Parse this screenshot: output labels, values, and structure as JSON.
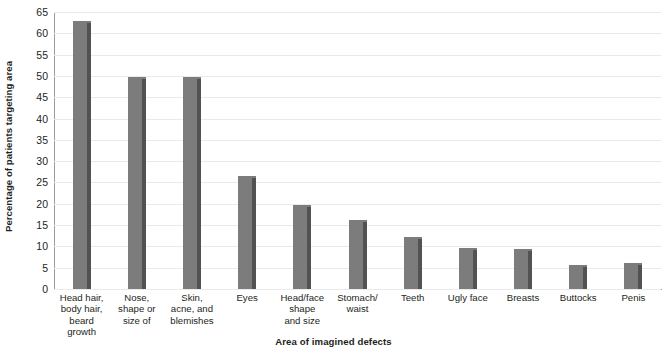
{
  "chart_data": {
    "type": "bar",
    "title": "",
    "xlabel": "Area of imagined defects",
    "ylabel": "Percentage of patients targeting area",
    "categories": [
      "Head hair,\nbody hair,\nbeard\ngrowth",
      "Nose,\nshape or\nsize of",
      "Skin,\nacne, and\nblemishes",
      "Eyes",
      "Head/face\nshape\nand size",
      "Stomach/\nwaist",
      "Teeth",
      "Ugly face",
      "Breasts",
      "Buttocks",
      "Penis"
    ],
    "values": [
      62.8,
      49.7,
      49.7,
      26.5,
      19.7,
      16.3,
      12.1,
      9.6,
      9.4,
      5.6,
      6.1
    ],
    "ylim": [
      0,
      65
    ],
    "ytick_step": 5,
    "yticks": [
      0,
      5,
      10,
      15,
      20,
      25,
      30,
      35,
      40,
      45,
      50,
      55,
      60,
      65
    ],
    "ytick_labels": [
      "0",
      "5",
      "10",
      "15",
      "20",
      "25",
      "30",
      "35",
      "40",
      "45",
      "50",
      "55",
      "60",
      "65"
    ],
    "grid": true,
    "grid_axis": "y",
    "legend": false,
    "legend_position": "none",
    "bar_color": "#7c7c7c",
    "bar_shadow_color": "#525252",
    "gridline_color": "#e9eaec",
    "axis_color": "#9a9da1",
    "text_color": "#231f20",
    "background_color": "#ffffff"
  }
}
